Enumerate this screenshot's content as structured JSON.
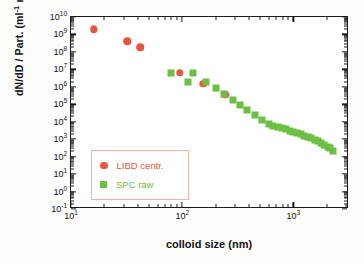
{
  "chart_data": {
    "type": "scatter",
    "title": "",
    "xlabel": "colloid size (nm)",
    "ylabel": "dN/dD / Part. (ml⁻¹ nm⁻¹)",
    "xscale": "log",
    "yscale": "log",
    "xlim": [
      10,
      3162
    ],
    "ylim": [
      0.1,
      10000000000.0
    ],
    "grid": false,
    "legend_position": "lower-left",
    "x_tick_labels": [
      "10¹",
      "10²",
      "10³"
    ],
    "x_tick_values": [
      10,
      100,
      1000
    ],
    "y_tick_labels": [
      "10⁰⁻¹",
      "10⁰",
      "10¹",
      "10²",
      "10³",
      "10⁴",
      "10⁵",
      "10⁶",
      "10⁷",
      "10⁸",
      "10⁹",
      "10¹⁰"
    ],
    "y_tick_values": [
      0.1,
      1,
      10,
      100,
      1000,
      10000,
      100000,
      1000000,
      10000000,
      100000000,
      1000000000,
      10000000000
    ],
    "series": [
      {
        "name": "LIBD centr.",
        "marker": "circle",
        "color": "#E8553C",
        "points": [
          [
            16,
            2000000000.0
          ],
          [
            32,
            400000000.0
          ],
          [
            42,
            180000000.0
          ],
          [
            95,
            6500000.0
          ],
          [
            155,
            1500000.0
          ],
          [
            245,
            350000.0
          ]
        ]
      },
      {
        "name": "SPC raw",
        "marker": "square",
        "color": "#6CBE45",
        "points": [
          [
            80,
            6000000.0
          ],
          [
            125,
            6000000.0
          ],
          [
            112,
            2000000.0
          ],
          [
            165,
            2000000.0
          ],
          [
            200,
            850000.0
          ],
          [
            240,
            400000.0
          ],
          [
            285,
            180000.0
          ],
          [
            330,
            90000.0
          ],
          [
            385,
            45000.0
          ],
          [
            450,
            24000.0
          ],
          [
            520,
            12000.0
          ],
          [
            600,
            7000.0
          ],
          [
            660,
            5800.0
          ],
          [
            720,
            5000.0
          ],
          [
            790,
            4200.0
          ],
          [
            860,
            3600.0
          ],
          [
            930,
            3000.0
          ],
          [
            1000,
            2600.0
          ],
          [
            1080,
            2200.0
          ],
          [
            1160,
            1900.0
          ],
          [
            1250,
            1600.0
          ],
          [
            1340,
            1300.0
          ],
          [
            1440,
            1100.0
          ],
          [
            1550,
            900.0
          ],
          [
            1660,
            750.0
          ],
          [
            1780,
            600.0
          ],
          [
            1900,
            480.0
          ],
          [
            2030,
            380.0
          ],
          [
            2150,
            300.0
          ],
          [
            2250,
            220.0
          ]
        ]
      }
    ]
  },
  "legend": {
    "entries": [
      {
        "label": "LIBD centr.",
        "color": "#E8553C",
        "marker": "circle"
      },
      {
        "label": "SPC raw",
        "color": "#6CBE45",
        "marker": "square"
      }
    ]
  },
  "axis_labels": {
    "x": "colloid size (nm)",
    "y_prefix": "dN/dD / Part. (ml",
    "y_sup1": "-1",
    "y_mid": " nm",
    "y_sup2": "-1",
    "y_suffix": ")"
  }
}
